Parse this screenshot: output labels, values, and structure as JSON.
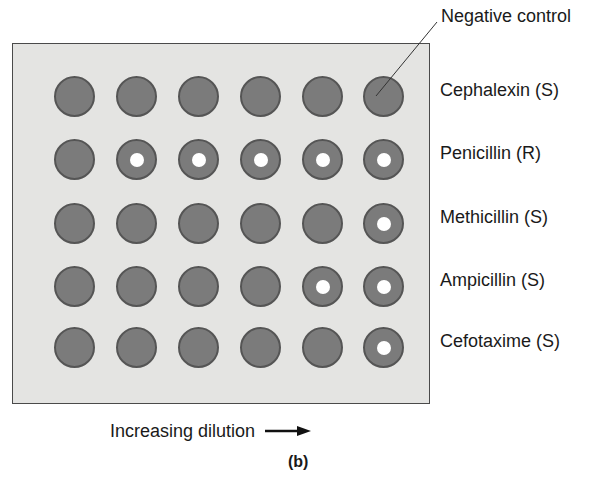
{
  "figure": {
    "panel_label": "(b)",
    "negative_control_label": "Negative control",
    "dilution_label": "Increasing dilution",
    "dilution_arrow_icon": "arrow-right-icon",
    "colors": {
      "plate_fill": "#e4e4e2",
      "plate_border": "#4a4a4a",
      "well_growth": "#7b7b7b",
      "well_rim": "#555555",
      "clear_zone": "#ffffff"
    },
    "columns": 6,
    "rows": [
      {
        "label": "Cephalexin (S)",
        "clear": [
          false,
          false,
          false,
          false,
          false,
          false
        ]
      },
      {
        "label": "Penicillin (R)",
        "clear": [
          false,
          true,
          true,
          true,
          true,
          true
        ]
      },
      {
        "label": "Methicillin (S)",
        "clear": [
          false,
          false,
          false,
          false,
          false,
          true
        ]
      },
      {
        "label": "Ampicillin (S)",
        "clear": [
          false,
          false,
          false,
          false,
          true,
          true
        ]
      },
      {
        "label": "Cefotaxime (S)",
        "clear": [
          false,
          false,
          false,
          false,
          false,
          true
        ]
      }
    ]
  }
}
